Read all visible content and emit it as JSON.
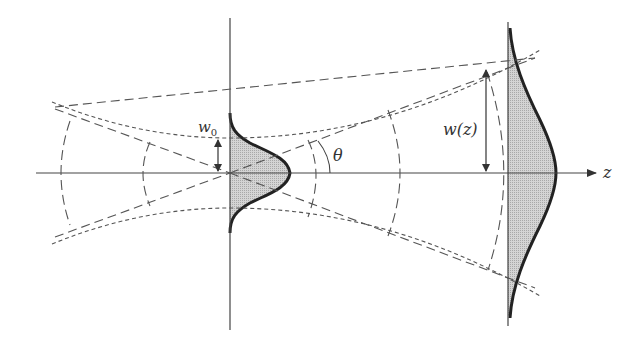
{
  "diagram": {
    "labels": {
      "waist": "w",
      "waist_subscript": "0",
      "divergence_angle": "θ",
      "beam_radius": "w(z)",
      "axis": "z"
    },
    "elements": [
      "optical axis z with arrow",
      "waist plane (vertical line) with Gaussian intensity profile",
      "far-field plane with wider Gaussian intensity profile",
      "beam envelope (short-dashed hyperbola)",
      "asymptotes (long-dashed lines) crossing at waist",
      "curved wavefronts (long-dashed arcs)",
      "double arrows marking w0 and w(z)",
      "arc marking divergence angle θ"
    ],
    "colors": {
      "line": "#333333",
      "fill": "#c8c8c8",
      "background": "#ffffff"
    }
  }
}
